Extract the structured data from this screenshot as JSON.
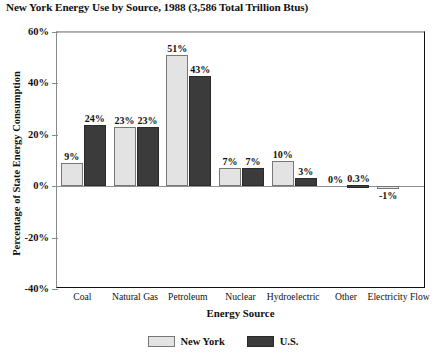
{
  "chart_data": {
    "type": "bar",
    "title": "New York Energy Use by Source, 1988 (3,586 Total Trillion Btus)",
    "xlabel": "Energy Source",
    "ylabel": "Percentage of State Energy Consumption",
    "categories": [
      "Coal",
      "Natural Gas",
      "Petroleum",
      "Nuclear",
      "Hydroelectric",
      "Other",
      "Electricity Flow"
    ],
    "series": [
      {
        "name": "New York",
        "color": "#e3e3e3",
        "values": [
          9,
          23,
          51,
          7,
          10,
          0,
          -1
        ],
        "labels": [
          "9%",
          "23%",
          "51%",
          "7%",
          "10%",
          "0%",
          "-1%"
        ]
      },
      {
        "name": "U.S.",
        "color": "#3b3b3b",
        "values": [
          24,
          23,
          43,
          7,
          3,
          0.3,
          null
        ],
        "labels": [
          "24%",
          "23%",
          "43%",
          "7%",
          "3%",
          "0.3%",
          ""
        ]
      }
    ],
    "ylim": [
      -40,
      60
    ],
    "yticks": [
      60,
      40,
      20,
      0,
      -20,
      -40
    ],
    "ytick_labels": [
      "60%",
      "40%",
      "20%",
      "0%",
      "-20%",
      "-40%"
    ],
    "grid": false,
    "legend_position": "bottom-center"
  }
}
